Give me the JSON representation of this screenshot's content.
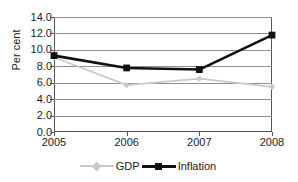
{
  "chart_data": {
    "type": "line",
    "title": "",
    "xlabel": "",
    "ylabel": "Per cent",
    "categories": [
      "2005",
      "2006",
      "2007",
      "2008"
    ],
    "ylim": [
      0.0,
      14.0
    ],
    "ytick_step": 2.0,
    "yticks": [
      "14.0",
      "12.0",
      "10.0",
      "8.0",
      "6.0",
      "4.0",
      "2.0",
      "0.0"
    ],
    "ytick_values": [
      14.0,
      12.0,
      10.0,
      8.0,
      6.0,
      4.0,
      2.0,
      0.0
    ],
    "grid": true,
    "legend_position": "bottom",
    "series": [
      {
        "name": "GDP",
        "values": [
          9.1,
          5.7,
          6.5,
          5.5
        ],
        "color": "#c9c9c9",
        "marker": "diamond"
      },
      {
        "name": "Inflation",
        "values": [
          9.3,
          7.8,
          7.6,
          11.8
        ],
        "color": "#111111",
        "marker": "square"
      }
    ]
  },
  "axis": {
    "y_title": "Per cent"
  },
  "legend": {
    "entries": [
      {
        "label": "GDP"
      },
      {
        "label": "Inflation"
      }
    ]
  }
}
